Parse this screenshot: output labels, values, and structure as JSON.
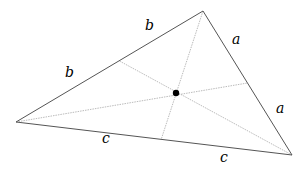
{
  "diagram": {
    "type": "triangle-medians-centroid",
    "vertices": {
      "top": [
        203,
        11
      ],
      "left": [
        16,
        122
      ],
      "right": [
        292,
        155
      ]
    },
    "midpoints": {
      "left_top": [
        119.5,
        61
      ],
      "top_right": [
        247.5,
        83
      ],
      "left_right": [
        161,
        140
      ]
    },
    "centroid": [
      176,
      93
    ],
    "colors": {
      "edge": "#555555",
      "median": "#aaaaaa",
      "centroid": "#000000"
    },
    "labels": [
      {
        "text": "b",
        "x": 145,
        "y": 18
      },
      {
        "text": "b",
        "x": 65,
        "y": 65
      },
      {
        "text": "a",
        "x": 232,
        "y": 32
      },
      {
        "text": "a",
        "x": 276,
        "y": 101
      },
      {
        "text": "c",
        "x": 102,
        "y": 131
      },
      {
        "text": "c",
        "x": 220,
        "y": 150
      }
    ]
  }
}
